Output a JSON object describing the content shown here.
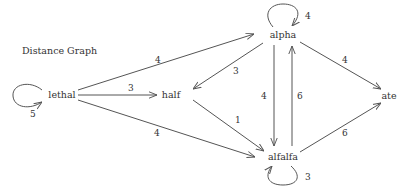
{
  "title": "Distance Graph",
  "colors": {
    "stroke": "#555555",
    "text": "#333333",
    "background": "#ffffff"
  },
  "nodes": [
    {
      "id": "lethal",
      "label": "lethal",
      "x": 62,
      "y": 94
    },
    {
      "id": "half",
      "label": "half",
      "x": 171,
      "y": 95
    },
    {
      "id": "alpha",
      "label": "alpha",
      "x": 283,
      "y": 35
    },
    {
      "id": "alfalfa",
      "label": "alfalfa",
      "x": 283,
      "y": 157
    },
    {
      "id": "ate",
      "label": "ate",
      "x": 389,
      "y": 96
    }
  ],
  "edges": [
    {
      "from": "lethal",
      "to": "lethal",
      "weight": "5",
      "self_loop": true
    },
    {
      "from": "lethal",
      "to": "alpha",
      "weight": "4"
    },
    {
      "from": "lethal",
      "to": "half",
      "weight": "3"
    },
    {
      "from": "lethal",
      "to": "alfalfa",
      "weight": "4"
    },
    {
      "from": "alpha",
      "to": "alpha",
      "weight": "4",
      "self_loop": true
    },
    {
      "from": "alpha",
      "to": "half",
      "weight": "3"
    },
    {
      "from": "alpha",
      "to": "alfalfa",
      "weight": "4"
    },
    {
      "from": "alpha",
      "to": "ate",
      "weight": "4"
    },
    {
      "from": "half",
      "to": "alfalfa",
      "weight": "1"
    },
    {
      "from": "alfalfa",
      "to": "alpha",
      "weight": "6"
    },
    {
      "from": "alfalfa",
      "to": "ate",
      "weight": "6"
    },
    {
      "from": "alfalfa",
      "to": "alfalfa",
      "weight": "3",
      "self_loop": true
    }
  ]
}
